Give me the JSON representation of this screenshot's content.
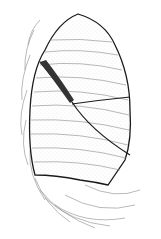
{
  "figure": {
    "panel_label": "A",
    "colors": {
      "outline": "#1a1a1a",
      "ribs": "#777777",
      "stipple": "#9a9a9a",
      "shaded_fissure": "#333333",
      "background": "#ffffff"
    }
  }
}
